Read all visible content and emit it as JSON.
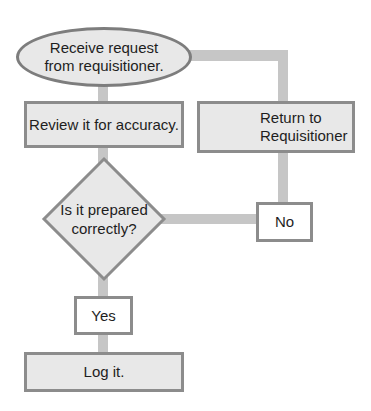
{
  "flowchart": {
    "nodes": {
      "start": {
        "label_line1": "Receive request",
        "label_line2": "from requisitioner.",
        "shape": "ellipse"
      },
      "review": {
        "label": "Review it for accuracy.",
        "shape": "rectangle"
      },
      "decision": {
        "label_line1": "Is it prepared",
        "label_line2": "correctly?",
        "shape": "diamond"
      },
      "no": {
        "label": "No",
        "shape": "rectangle-label"
      },
      "return": {
        "label_line1": "Return to",
        "label_line2": "Requisitioner",
        "shape": "rectangle"
      },
      "yes": {
        "label": "Yes",
        "shape": "rectangle-label"
      },
      "log": {
        "label": "Log it.",
        "shape": "rectangle"
      }
    },
    "edges": [
      {
        "from": "start",
        "to": "review"
      },
      {
        "from": "review",
        "to": "decision"
      },
      {
        "from": "decision",
        "to": "no"
      },
      {
        "from": "no",
        "to": "return"
      },
      {
        "from": "return",
        "to": "start"
      },
      {
        "from": "decision",
        "to": "yes"
      },
      {
        "from": "yes",
        "to": "log"
      }
    ],
    "colors": {
      "fill": "#e8e8e8",
      "border": "#8c8c8c",
      "connector": "#c6c6c6",
      "text": "#1e1e1e"
    }
  }
}
